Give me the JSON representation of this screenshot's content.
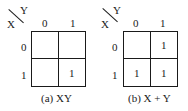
{
  "maps": [
    {
      "var_row": "X",
      "var_col": "Y",
      "col_headers": [
        "0",
        "1"
      ],
      "row_headers": [
        "0",
        "1"
      ],
      "cells": [
        [
          "",
          ""
        ],
        [
          "",
          "1"
        ]
      ],
      "caption": "(a) XY"
    },
    {
      "var_row": "X",
      "var_col": "Y",
      "col_headers": [
        "0",
        "1"
      ],
      "row_headers": [
        "0",
        "1"
      ],
      "cells": [
        [
          "",
          "1"
        ],
        [
          "1",
          "1"
        ]
      ],
      "caption": "(b) X + Y"
    }
  ]
}
